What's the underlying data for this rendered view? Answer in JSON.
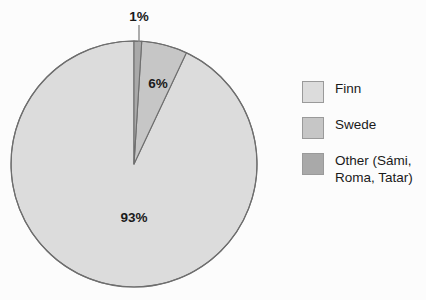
{
  "chart_data": {
    "type": "pie",
    "title": "",
    "subtitle": "",
    "xlabel": "",
    "ylabel": "",
    "grid": false,
    "legend_position": "right",
    "categories": [
      "Finn",
      "Swede",
      "Other (Sámi, Roma, Tatar)"
    ],
    "values": [
      93,
      6,
      1
    ],
    "data_labels": [
      "93%",
      "6%",
      "1%"
    ],
    "colors": [
      "#dcdcdc",
      "#c6c6c6",
      "#a9a9a9"
    ],
    "slices": [
      {
        "name": "Finn",
        "value": 93,
        "label": "93%",
        "color": "#dcdcdc"
      },
      {
        "name": "Swede",
        "value": 6,
        "label": "6%",
        "color": "#c6c6c6"
      },
      {
        "name": "Other (Sámi, Roma, Tatar)",
        "value": 1,
        "label": "1%",
        "color": "#a9a9a9"
      }
    ],
    "start_angle_deg": 0,
    "direction": "clockwise",
    "units": "percent"
  },
  "pie": {
    "label_93": "93%",
    "label_6": "6%",
    "label_1": "1%"
  },
  "legend": {
    "items": [
      {
        "label": "Finn",
        "color": "#dcdcdc"
      },
      {
        "label": "Swede",
        "color": "#c6c6c6"
      },
      {
        "label": "Other (Sámi,\nRoma, Tatar)",
        "color": "#a9a9a9"
      }
    ]
  },
  "style": {
    "background": "#fcfcfc",
    "outline": "#6e6e6e",
    "text": "#1a1a1a"
  }
}
